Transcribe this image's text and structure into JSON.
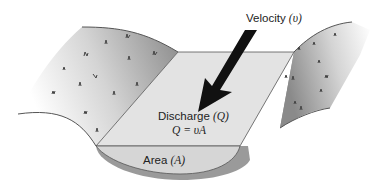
{
  "diagram": {
    "velocity_label": "Velocity",
    "velocity_symbol": "(υ)",
    "discharge_label": "Discharge",
    "discharge_symbol": "(Q)",
    "equation": "Q = υA",
    "area_label": "Area",
    "area_symbol": "(A)"
  },
  "colors": {
    "bank_dark": "#8a8a8a",
    "bank_light": "#ffffff",
    "water_surface": "#e3e3e3",
    "cross_section": "#d6d6d6",
    "channel_bed": "#9a9a9a",
    "arrow": "#111111",
    "outline": "#555555"
  }
}
